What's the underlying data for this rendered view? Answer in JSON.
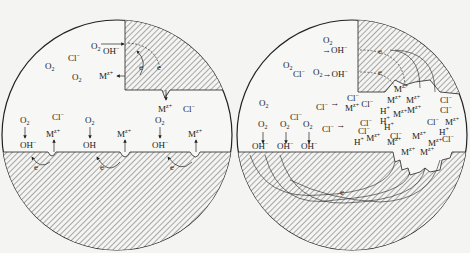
{
  "diagram": {
    "type": "pitting-corrosion-mechanism",
    "panels": [
      {
        "id": "left",
        "description": "Initial stage: uniform corrosion with local anodes/cathodes",
        "species": [
          "O2",
          "Cl-",
          "OH-",
          "M2+",
          "e"
        ],
        "labels": {
          "o2": "O",
          "o2_sub": "2",
          "cl": "Cl",
          "cl_sup": "−",
          "oh": "OH",
          "oh_sup": "−",
          "m": "M",
          "m_sup": "z+",
          "e": "e"
        }
      },
      {
        "id": "right",
        "description": "Pit growth: autocatalytic acidification with Cl- migration and H+ accumulation",
        "species": [
          "O2",
          "Cl-",
          "OH-",
          "Mz+",
          "H+",
          "e"
        ],
        "labels": {
          "o2": "O",
          "o2_sub": "2",
          "cl": "Cl",
          "cl_sup": "−",
          "oh": "OH",
          "oh_sup": "−",
          "m": "M",
          "m_sup": "z+",
          "h": "H",
          "h_sup": "+",
          "e": "e"
        }
      }
    ]
  }
}
